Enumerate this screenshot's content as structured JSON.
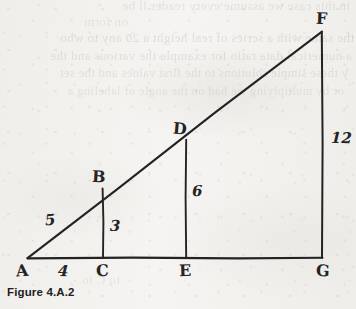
{
  "figure": {
    "caption": "Figure 4.A.2",
    "ink_color": "#232323",
    "paper_color": "#f5f4f2",
    "vertices": [
      {
        "label": "A",
        "x": 27,
        "y": 258
      },
      {
        "label": "B",
        "x": 103,
        "y": 188
      },
      {
        "label": "C",
        "x": 103,
        "y": 258
      },
      {
        "label": "D",
        "x": 186,
        "y": 140
      },
      {
        "label": "E",
        "x": 186,
        "y": 258
      },
      {
        "label": "F",
        "x": 322,
        "y": 32
      },
      {
        "label": "G",
        "x": 322,
        "y": 258
      }
    ],
    "vertex_labels": {
      "a": "A",
      "b": "B",
      "c": "C",
      "d": "D",
      "e": "E",
      "f": "F",
      "g": "G"
    },
    "measurements": {
      "ac": "4",
      "ab": "5",
      "bc": "3",
      "de": "6",
      "fg": "12"
    },
    "segments": [
      {
        "name": "hypotenuse-af",
        "from": "A",
        "to": "F"
      },
      {
        "name": "base-ag",
        "from": "A",
        "to": "G"
      },
      {
        "name": "vertical-bc",
        "from": "B",
        "to": "C"
      },
      {
        "name": "vertical-de",
        "from": "D",
        "to": "E"
      },
      {
        "name": "vertical-fg",
        "from": "F",
        "to": "G"
      }
    ]
  },
  "showthrough": {
    "lines": [
      {
        "text": "in this case we assume every reader ll be",
        "top": -2,
        "left": 6,
        "size": 13,
        "opacity": 0.3
      },
      {
        "text": "on form",
        "top": 14,
        "left": 228,
        "size": 13,
        "opacity": 0.26
      },
      {
        "text": "the same with a series of real height a 20 any to who",
        "top": 30,
        "left": 2,
        "size": 13,
        "opacity": 0.34
      },
      {
        "text": "a numerical data ratio for example the various and the",
        "top": 48,
        "left": 4,
        "size": 13,
        "opacity": 0.32
      },
      {
        "text": "y these simple solutions to the first values and the set",
        "top": 66,
        "left": 8,
        "size": 12.5,
        "opacity": 0.3
      },
      {
        "text": "or by multiplying we had on the angle of labeling a",
        "top": 84,
        "left": 12,
        "size": 12.5,
        "opacity": 0.28
      },
      {
        "text": "to C to",
        "top": 272,
        "left": 236,
        "size": 13,
        "opacity": 0.24
      }
    ]
  }
}
